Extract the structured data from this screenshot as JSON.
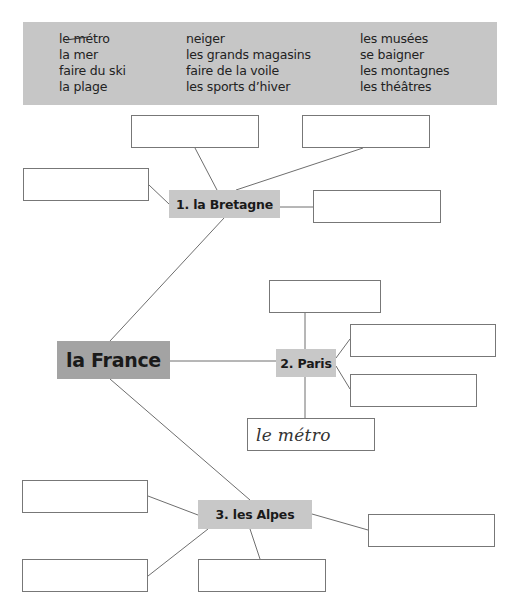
{
  "header": {
    "cut_off_text": "vocabulaire."
  },
  "word_bank": {
    "columns": [
      [
        {
          "text": "le métro",
          "struck_through": true
        },
        {
          "text": "la mer",
          "struck_through": false
        },
        {
          "text": "faire du ski",
          "struck_through": false
        },
        {
          "text": "la plage",
          "struck_through": false
        }
      ],
      [
        {
          "text": "neiger",
          "struck_through": false
        },
        {
          "text": "les grands magasins",
          "struck_through": false
        },
        {
          "text": "faire de la voile",
          "struck_through": false
        },
        {
          "text": "les sports d’hiver",
          "struck_through": false
        }
      ],
      [
        {
          "text": "les musées",
          "struck_through": false
        },
        {
          "text": "se baigner",
          "struck_through": false
        },
        {
          "text": "les montagnes",
          "struck_through": false
        },
        {
          "text": "les théâtres",
          "struck_through": false
        }
      ]
    ],
    "background_color": "#c6c6c6"
  },
  "diagram": {
    "root": {
      "label": "la France",
      "color": "#a3a3a3"
    },
    "branches": [
      {
        "label": "1. la Bretagne",
        "color": "#c8c8c8",
        "answer_boxes": [
          "",
          "",
          "",
          ""
        ]
      },
      {
        "label": "2. Paris",
        "color": "#c8c8c8",
        "answer_boxes": [
          "",
          "",
          "",
          "le métro"
        ]
      },
      {
        "label": "3. les Alpes",
        "color": "#c8c8c8",
        "answer_boxes": [
          "",
          "",
          "",
          ""
        ]
      }
    ]
  }
}
